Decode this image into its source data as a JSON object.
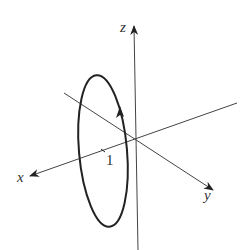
{
  "diagram": {
    "type": "3d-coordinate-axes-with-circle",
    "axes": {
      "x": {
        "label": "x"
      },
      "y": {
        "label": "y"
      },
      "z": {
        "label": "z"
      }
    },
    "circle": {
      "radius_label": "1",
      "orientation": "counterclockwise-arrow",
      "plane": "parallel to yz-plane, offset along x"
    },
    "colors": {
      "stroke": "#222222",
      "axis": "#444444",
      "background": "#ffffff"
    }
  }
}
